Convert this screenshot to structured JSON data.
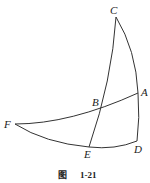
{
  "figure": {
    "caption_prefix": "图",
    "caption_number": "1-21"
  },
  "points": {
    "A": {
      "label": "A",
      "x": 138,
      "y": 93
    },
    "B": {
      "label": "B",
      "x": 101,
      "y": 107
    },
    "C": {
      "label": "C",
      "x": 116,
      "y": 17
    },
    "D": {
      "label": "D",
      "x": 137,
      "y": 141
    },
    "E": {
      "label": "E",
      "x": 89,
      "y": 147
    },
    "F": {
      "label": "F",
      "x": 15,
      "y": 124
    }
  },
  "arcs": [
    "C-A",
    "A-D",
    "D-E",
    "E-F",
    "F-B-A",
    "C-B-E"
  ],
  "colors": {
    "stroke": "#333333",
    "background": "#ffffff"
  }
}
